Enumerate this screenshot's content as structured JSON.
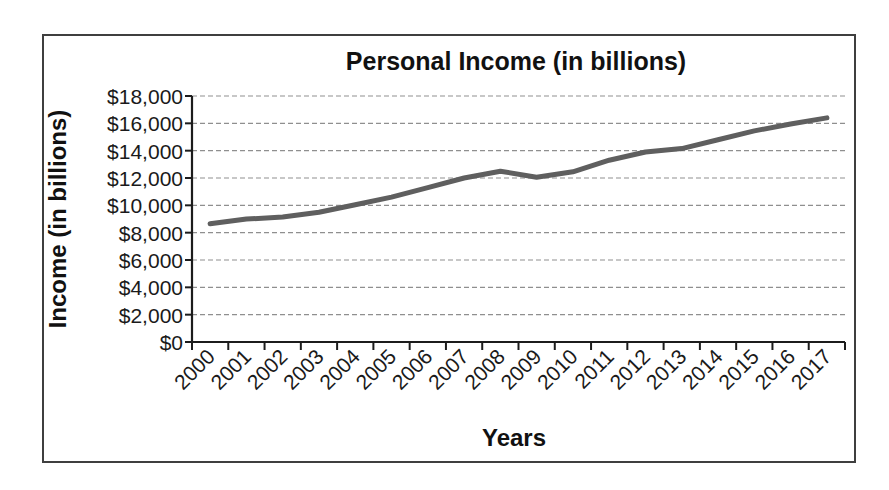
{
  "figure": {
    "title": "Personal Income (in billions)",
    "xlabel": "Years",
    "ylabel": "Income (in billions)"
  },
  "chart_data": {
    "type": "line",
    "title": "Personal Income (in billions)",
    "xlabel": "Years",
    "ylabel": "Income (in billions)",
    "categories": [
      "2000",
      "2001",
      "2002",
      "2003",
      "2004",
      "2005",
      "2006",
      "2007",
      "2008",
      "2009",
      "2010",
      "2011",
      "2012",
      "2013",
      "2014",
      "2015",
      "2016",
      "2017"
    ],
    "values": [
      8650,
      8990,
      9150,
      9500,
      10050,
      10600,
      11300,
      12000,
      12500,
      12050,
      12450,
      13300,
      13900,
      14150,
      14800,
      15450,
      15950,
      16400
    ],
    "ylim": [
      0,
      18000
    ],
    "ytick_step": 2000,
    "y_tick_labels": [
      "$0",
      "$2,000",
      "$4,000",
      "$6,000",
      "$8,000",
      "$10,000",
      "$12,000",
      "$14,000",
      "$16,000",
      "$18,000"
    ],
    "grid": true,
    "legend": false
  },
  "style": {
    "line_color": "#5f5f5f",
    "grid_color": "#8f8f8f",
    "axis_color": "#1c1c1c",
    "text_color": "#1a1a1a",
    "border_color": "#3f3f3f",
    "background": "#ffffff"
  }
}
